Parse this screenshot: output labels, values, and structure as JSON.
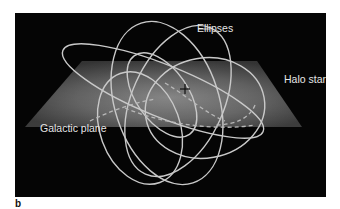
{
  "figure": {
    "panel_letter": "b",
    "labels": {
      "ellipses": "Ellipses",
      "halo_stars": "Halo stars",
      "galactic_plane": "Galactic plane"
    },
    "colors": {
      "background": "#050505",
      "plane_light": "#8a8a8a",
      "plane_dark": "#3a3a3a",
      "orbit_stroke": "#c9c9c9",
      "label_text": "#e6e6e6"
    },
    "elements": [
      {
        "type": "plane",
        "name": "galactic-plane"
      },
      {
        "type": "orbit",
        "count": 6,
        "style": "solid with dashed segments below plane"
      },
      {
        "type": "marker",
        "name": "galactic-center",
        "glyph": "+"
      }
    ]
  }
}
